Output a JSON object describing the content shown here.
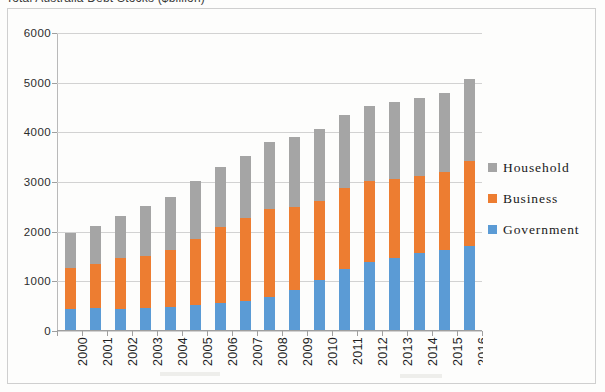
{
  "chart_title": "Total Australia Debt Stocks ($billion)",
  "legend": {
    "position": "right",
    "items": [
      {
        "label": "Household",
        "color": "#a5a5a5",
        "key": "household"
      },
      {
        "label": "Business",
        "color": "#ed7d31",
        "key": "business"
      },
      {
        "label": "Government",
        "color": "#5b9bd5",
        "key": "government"
      }
    ]
  },
  "y_axis": {
    "ticks": [
      "0",
      "1000",
      "2000",
      "3000",
      "4000",
      "5000",
      "6000"
    ],
    "min": 0,
    "max": 6000,
    "step": 1000
  },
  "x_axis": {
    "labels": [
      "2000",
      "2001",
      "2002",
      "2003",
      "2004",
      "2005",
      "2006",
      "2007",
      "2008",
      "2009",
      "2010",
      "2011",
      "2012",
      "2013",
      "2014",
      "2015",
      "2016"
    ],
    "label_rotation": -90
  },
  "chart_data": {
    "type": "bar",
    "stacked": true,
    "title": "Total Australia Debt Stocks ($billion)",
    "xlabel": "",
    "ylabel": "",
    "ylim": [
      0,
      6000
    ],
    "grid": true,
    "legend_position": "right",
    "categories": [
      "2000",
      "2001",
      "2002",
      "2003",
      "2004",
      "2005",
      "2006",
      "2007",
      "2008",
      "2009",
      "2010",
      "2011",
      "2012",
      "2013",
      "2014",
      "2015",
      "2016"
    ],
    "series": [
      {
        "name": "Government",
        "color": "#5b9bd5",
        "values": [
          430,
          440,
          430,
          440,
          470,
          500,
          540,
          580,
          660,
          800,
          1010,
          1220,
          1360,
          1450,
          1560,
          1620,
          1700
        ]
      },
      {
        "name": "Business",
        "color": "#ed7d31",
        "values": [
          820,
          890,
          1020,
          1060,
          1150,
          1330,
          1530,
          1680,
          1780,
          1680,
          1580,
          1630,
          1640,
          1600,
          1550,
          1560,
          1700
        ]
      },
      {
        "name": "Household",
        "color": "#a5a5a5",
        "values": [
          700,
          770,
          850,
          1000,
          1050,
          1170,
          1210,
          1250,
          1350,
          1400,
          1460,
          1480,
          1510,
          1540,
          1560,
          1590,
          1650
        ]
      }
    ],
    "totals": [
      1950,
      2100,
      2300,
      2500,
      2670,
      3000,
      3280,
      3510,
      3790,
      3880,
      4050,
      4330,
      4510,
      4590,
      4670,
      4770,
      5050
    ]
  }
}
